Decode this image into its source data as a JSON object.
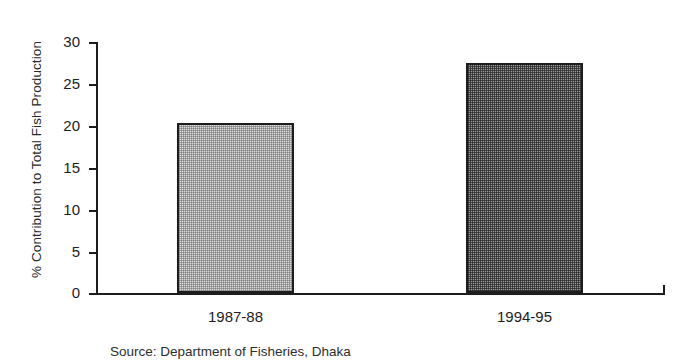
{
  "chart_data": {
    "type": "bar",
    "title": "",
    "xlabel": "",
    "ylabel": "% Contribution to Total Fish Production",
    "categories": [
      "1987-88",
      "1994-95"
    ],
    "values": [
      20.2,
      27.4
    ],
    "series": [
      {
        "name": "% Contribution to Total Fish Production",
        "values": [
          20.2,
          27.4
        ]
      }
    ],
    "ylim": [
      0,
      30
    ],
    "yticks": [
      0,
      5,
      10,
      15,
      20,
      25,
      30
    ],
    "ytick_labels": [
      "0",
      "5",
      "10",
      "15",
      "20",
      "25",
      "30"
    ],
    "grid": false,
    "legend": false,
    "legend_position": "none",
    "bar_fills": [
      "light-gray-dither",
      "dark-gray-dither"
    ],
    "bar_colors": [
      "#dddddd",
      "#9a9a9a"
    ],
    "bar_edge_color": "#1d1d1d",
    "axis_color": "#1d1d1d",
    "background_color": "#ffffff"
  },
  "caption": {
    "source_note": "Source: Department of Fisheries, Dhaka"
  }
}
